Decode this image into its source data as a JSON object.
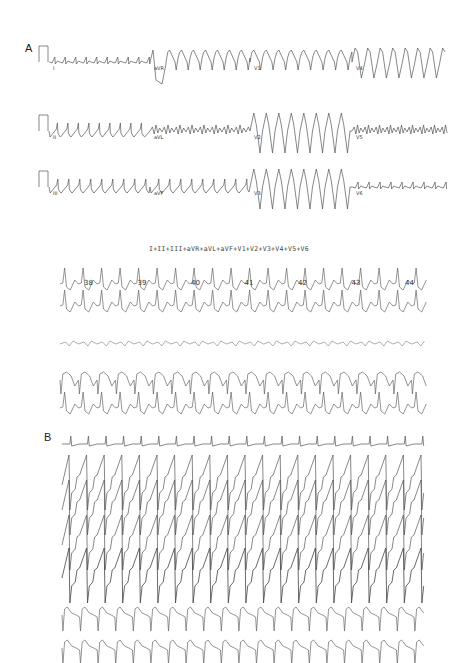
{
  "figure": {
    "panels": [
      {
        "label": "A",
        "description": "12-lead ECG in three rows",
        "rows": [
          {
            "leads": [
              "I",
              "aVR",
              "V1",
              "V4"
            ]
          },
          {
            "leads": [
              "II",
              "aVL",
              "V2",
              "V5"
            ]
          },
          {
            "leads": [
              "III",
              "aVF",
              "V3",
              "V6"
            ]
          }
        ],
        "sum_caption": "I+II+III+aVR+aVL+aVF+V1+V2+V3+V4+V5+V6",
        "averaged_strips": {
          "beat_numbers": [
            "38",
            "39",
            "40",
            "41",
            "42",
            "43",
            "44"
          ],
          "strip_count": 5
        }
      },
      {
        "label": "B",
        "description": "Multichannel paced tachycardia recording",
        "channel_count": 8
      }
    ]
  }
}
